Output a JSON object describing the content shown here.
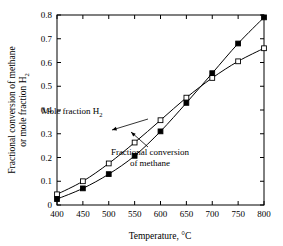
{
  "chart_data": {
    "type": "line",
    "title": "",
    "subtitle": "",
    "xlabel": "Temperature, °C",
    "ylabel_line1": "Fractional conversion of methane",
    "ylabel_line2": "or mole fraction H",
    "ylabel_line2_sub": "2",
    "xlim": [
      400,
      800
    ],
    "ylim": [
      0,
      0.8
    ],
    "xticks": [
      400,
      450,
      500,
      550,
      600,
      650,
      700,
      750,
      800
    ],
    "xtick_labels": [
      "400",
      "450",
      "500",
      "550",
      "600",
      "650",
      "700",
      "750",
      "800"
    ],
    "yticks": [
      0,
      0.1,
      0.2,
      0.3,
      0.4,
      0.5,
      0.6,
      0.7,
      0.8
    ],
    "ytick_labels": [
      "0",
      "0.1",
      "0.2",
      "0.3",
      "0.4",
      "0.5",
      "0.6",
      "0.7",
      "0.8"
    ],
    "grid": false,
    "legend": "none",
    "x": [
      400,
      450,
      500,
      550,
      600,
      650,
      700,
      750,
      800
    ],
    "series": [
      {
        "name": "Mole fraction H2",
        "marker": "open-square",
        "values": [
          0.045,
          0.1,
          0.175,
          0.263,
          0.357,
          0.452,
          0.535,
          0.605,
          0.66
        ]
      },
      {
        "name": "Fractional conversion of methane",
        "marker": "filled-square",
        "values": [
          0.025,
          0.07,
          0.13,
          0.207,
          0.31,
          0.43,
          0.555,
          0.68,
          0.79
        ]
      }
    ],
    "annotations": [
      {
        "id": "annotation-mole-fraction",
        "text_line1": "Mole fraction H",
        "text_sub": "2",
        "text_line2": "",
        "label_x": 72,
        "label_y": 114,
        "arrow_from_x": 148,
        "arrow_from_y": 119,
        "arrow_to_x": 112,
        "arrow_to_y": 130
      },
      {
        "id": "annotation-fractional-conversion",
        "text_line1": "Fractional conversion",
        "text_sub": "",
        "text_line2": "of methane",
        "label_x": 150,
        "label_y": 155,
        "arrow_from_x": 148,
        "arrow_from_y": 147,
        "arrow_to_x": 131,
        "arrow_to_y": 132
      }
    ],
    "colors": {
      "line": "#000000",
      "axis": "#000000",
      "marker_fill_open": "#ffffff",
      "marker_fill_closed": "#000000",
      "background": "#ffffff"
    }
  }
}
